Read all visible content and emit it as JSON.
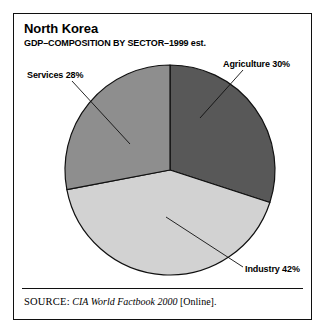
{
  "figure": {
    "title": "North Korea",
    "subtitle": "GDP–COMPOSITION BY SECTOR–1999 est.",
    "source_kicker": "SOURCE:",
    "source_work": "CIA World Factbook 2000",
    "source_suffix": "[Online].",
    "frame_color": "#101010",
    "background": "#ffffff"
  },
  "labels": {
    "services": "Services 28%",
    "agriculture": "Agriculture 30%",
    "industry": "Industry 42%"
  },
  "chart_data": {
    "type": "pie",
    "title": "North Korea",
    "subtitle": "GDP–COMPOSITION BY SECTOR–1999 est.",
    "unit": "percent of GDP",
    "categories": [
      "Agriculture",
      "Industry",
      "Services"
    ],
    "values": [
      30,
      42,
      28
    ],
    "labels": [
      "Agriculture 30%",
      "Industry 42%",
      "Services 28%"
    ],
    "colors": [
      "#585858",
      "#d2d2d2",
      "#8e8e8e"
    ],
    "start_angle_deg": 0,
    "direction": "clockwise",
    "slice_border_color": "#101010",
    "legend": "callout-labels",
    "grid": false,
    "slices": [
      {
        "name": "Agriculture",
        "value": 30,
        "color": "#585858",
        "start_deg": 0,
        "end_deg": 108
      },
      {
        "name": "Industry",
        "value": 42,
        "color": "#d2d2d2",
        "start_deg": 108,
        "end_deg": 259.2
      },
      {
        "name": "Services",
        "value": 28,
        "color": "#8e8e8e",
        "start_deg": 259.2,
        "end_deg": 360
      }
    ]
  }
}
